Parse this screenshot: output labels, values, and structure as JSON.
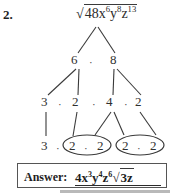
{
  "problem": {
    "number": "2.",
    "root_expression": {
      "radical_symbol": "√",
      "radicand_text": "48x⁶y⁸z¹³",
      "coefficient": "48",
      "variables": [
        {
          "base": "x",
          "exponent": "6"
        },
        {
          "base": "y",
          "exponent": "8"
        },
        {
          "base": "z",
          "exponent": "13"
        }
      ]
    }
  },
  "factor_tree": {
    "multiplication_dot": "·",
    "levels": [
      {
        "level": 1,
        "nodes": [
          {
            "id": "root",
            "label": "48x⁶y⁸z¹³"
          }
        ]
      },
      {
        "level": 2,
        "nodes": [
          {
            "id": "n6",
            "label": "6"
          },
          {
            "id": "n8",
            "label": "8"
          }
        ],
        "separators": [
          "·"
        ]
      },
      {
        "level": 3,
        "nodes": [
          {
            "id": "n3a",
            "label": "3"
          },
          {
            "id": "n2a",
            "label": "2"
          },
          {
            "id": "n4",
            "label": "4"
          },
          {
            "id": "n2b",
            "label": "2"
          }
        ],
        "separators": [
          "·",
          "·",
          "·"
        ]
      },
      {
        "level": 4,
        "nodes": [
          {
            "id": "b3",
            "label": "3"
          },
          {
            "id": "b2a",
            "label": "2"
          },
          {
            "id": "b2b",
            "label": "2"
          },
          {
            "id": "b2c",
            "label": "2"
          },
          {
            "id": "b2d",
            "label": "2"
          }
        ],
        "separators": [
          "·",
          "·",
          "·"
        ]
      }
    ],
    "circled_pairs": [
      {
        "id": "pair-1",
        "contents": "2 · 2"
      },
      {
        "id": "pair-2",
        "contents": "2 · 2"
      }
    ]
  },
  "answer": {
    "label": "Answer:",
    "value": "4x³y⁴z⁶√3z",
    "coefficient": "4",
    "variables": [
      {
        "base": "x",
        "exponent": "3"
      },
      {
        "base": "y",
        "exponent": "4"
      },
      {
        "base": "z",
        "exponent": "6"
      }
    ],
    "radical_part": "3z"
  },
  "colors": {
    "ink": "#2b2b2b",
    "box_border": "#555555",
    "background": "#ffffff",
    "shade": "#b9b9b9"
  }
}
